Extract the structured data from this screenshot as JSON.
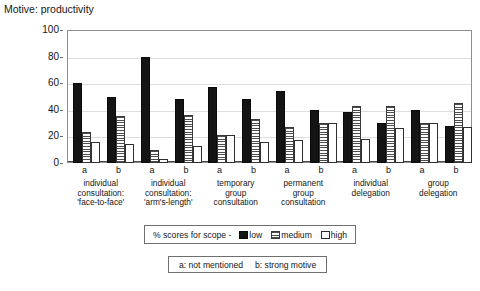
{
  "chart_data": {
    "type": "bar",
    "title": "Motive: productivity",
    "xlabel": "",
    "ylabel": "",
    "ylim": [
      0,
      100
    ],
    "yticks": [
      0,
      20,
      40,
      60,
      80,
      100
    ],
    "grid": true,
    "legend_position": "below-axis",
    "legend_prefix": "% scores for scope -",
    "categories": [
      "individual consultation: 'face-to-face' a",
      "individual consultation: 'face-to-face' b",
      "individual consultation: 'arm's-length' a",
      "individual consultation: 'arm's-length' b",
      "temporary group consultation a",
      "temporary group consultation b",
      "permanent group consultation a",
      "permanent group consultation b",
      "individual delegation a",
      "individual delegation b",
      "group delegation a",
      "group delegation b"
    ],
    "series": [
      {
        "name": "low",
        "values": [
          60,
          50,
          80,
          48,
          57,
          48,
          54,
          40,
          38,
          30,
          40,
          28
        ]
      },
      {
        "name": "medium",
        "values": [
          23,
          35,
          10,
          36,
          21,
          33,
          27,
          30,
          43,
          43,
          30,
          45
        ]
      },
      {
        "name": "high",
        "values": [
          16,
          14,
          3,
          13,
          21,
          16,
          17,
          30,
          18,
          26,
          30,
          27
        ]
      }
    ],
    "groups": [
      {
        "caption": "individual\nconsultation:\n'face-to-face'",
        "sub_a": "a",
        "sub_b": "b"
      },
      {
        "caption": "individual\nconsultation:\n'arm's-length'",
        "sub_a": "a",
        "sub_b": "b"
      },
      {
        "caption": "temporary\ngroup\nconsultation",
        "sub_a": "a",
        "sub_b": "b"
      },
      {
        "caption": "permanent\ngroup\nconsultation",
        "sub_a": "a",
        "sub_b": "b"
      },
      {
        "caption": "individual\ndelegation",
        "sub_a": "a",
        "sub_b": "b"
      },
      {
        "caption": "group\ndelegation",
        "sub_a": "a",
        "sub_b": "b"
      }
    ],
    "annotations": {
      "footnote_a": "a: not mentioned",
      "footnote_b": "b: strong motive"
    },
    "colors": {
      "low": "#141414",
      "medium": "#4d4d4d",
      "high": "#ffffff",
      "frame": "#8e8e8e",
      "grid": "#dedede",
      "text": "#161616"
    }
  }
}
